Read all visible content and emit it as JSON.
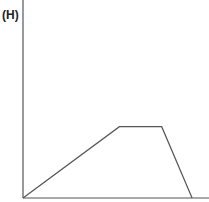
{
  "panel": {
    "label": "(H)"
  },
  "colors": {
    "axis": "#555555",
    "line": "#555555"
  },
  "chart_data": {
    "type": "line",
    "title": "",
    "panel_label": "(H)",
    "xlabel": "",
    "ylabel": "",
    "grid": false,
    "legend": null,
    "x": [
      0,
      0.57,
      0.82,
      1.0
    ],
    "values": [
      0,
      0.36,
      0.36,
      0
    ],
    "xlim": [
      0,
      1.1
    ],
    "ylim": [
      0,
      1.0
    ]
  }
}
